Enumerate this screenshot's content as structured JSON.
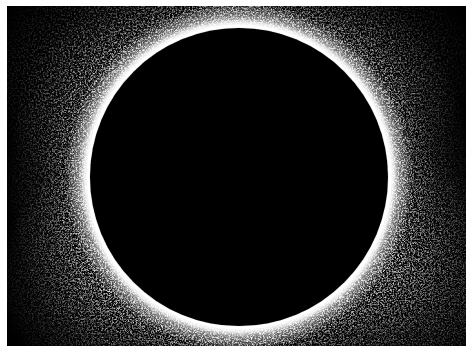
{
  "image": {
    "subject": "total solar eclipse with corona",
    "alt": "Total solar eclipse: black lunar disk surrounded by a bright white speckled corona",
    "colors": {
      "background_border": "#ffffff",
      "sky": "#000000",
      "moon": "#000000",
      "corona": "#ffffff"
    },
    "moon": {
      "cx": 232,
      "cy": 171,
      "r": 149
    }
  }
}
